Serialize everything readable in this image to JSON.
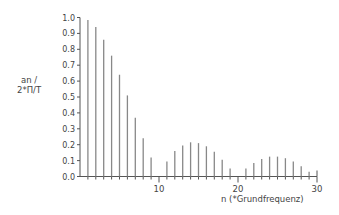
{
  "chart_data": {
    "type": "bar",
    "title": "",
    "xlabel": "n (*Grundfrequenz)",
    "ylabel_line1": "an /",
    "ylabel_line2": "2*Π/T",
    "ylabel": "an / 2*Π/T",
    "xlim": [
      0,
      30
    ],
    "ylim": [
      0.0,
      1.0
    ],
    "x_ticks": [
      10,
      20,
      30
    ],
    "x_minor_step": 1,
    "y_ticks": [
      "0.0",
      "0.1",
      "0.2",
      "0.3",
      "0.4",
      "0.5",
      "0.6",
      "0.7",
      "0.8",
      "0.9",
      "1.0"
    ],
    "grid": false,
    "legend": null,
    "x": [
      1,
      2,
      3,
      4,
      5,
      6,
      7,
      8,
      9,
      10,
      11,
      12,
      13,
      14,
      15,
      16,
      17,
      18,
      19,
      20,
      21,
      22,
      23,
      24,
      25,
      26,
      27,
      28,
      29
    ],
    "values": [
      0.985,
      0.94,
      0.86,
      0.76,
      0.64,
      0.51,
      0.37,
      0.24,
      0.12,
      0.0,
      0.095,
      0.16,
      0.195,
      0.215,
      0.21,
      0.19,
      0.155,
      0.105,
      0.05,
      0.0,
      0.05,
      0.085,
      0.11,
      0.125,
      0.125,
      0.115,
      0.095,
      0.065,
      0.03
    ],
    "colors": {
      "bar": "#888888",
      "axis": "#555555",
      "text": "#444444"
    }
  }
}
